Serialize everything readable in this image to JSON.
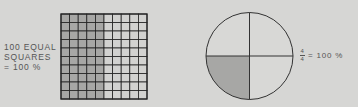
{
  "grid": {
    "label_lines": [
      "100 EQUAL",
      "SQUARES",
      "= 100 %"
    ],
    "rows": 10,
    "cols": 10,
    "shaded_cols": 5,
    "shaded_fraction": 0.5,
    "shade_color": "#a7a7a5",
    "light_color": "#d2d2d0",
    "line_color": "#222222"
  },
  "circle": {
    "parts": 4,
    "shaded_parts": [
      2
    ],
    "shaded_fraction": 0.25,
    "shade_color": "#a7a7a5",
    "light_color": "#d8d8d6",
    "line_color": "#333333",
    "fraction_numerator": "4",
    "fraction_denominator": "4",
    "equation_text": "= 100 %"
  }
}
